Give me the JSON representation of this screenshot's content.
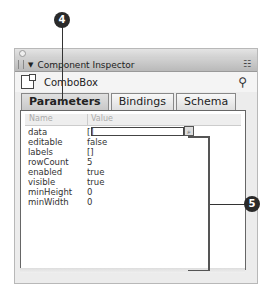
{
  "panel": {
    "title": "Component Inspector",
    "component_name": "ComboBox",
    "icons": {
      "menu": "☷",
      "help": "⚲"
    }
  },
  "tabs": [
    {
      "label": "Parameters",
      "active": true
    },
    {
      "label": "Bindings",
      "active": false
    },
    {
      "label": "Schema",
      "active": false
    }
  ],
  "grid": {
    "headers": {
      "name": "Name",
      "value": "Value"
    },
    "rows": [
      {
        "name": "data",
        "value": "[]"
      },
      {
        "name": "editable",
        "value": "false"
      },
      {
        "name": "labels",
        "value": "[]"
      },
      {
        "name": "rowCount",
        "value": "5"
      },
      {
        "name": "enabled",
        "value": "true"
      },
      {
        "name": "visible",
        "value": "true"
      },
      {
        "name": "minHeight",
        "value": "0"
      },
      {
        "name": "minWidth",
        "value": "0"
      }
    ],
    "search_button_glyph": "🔍"
  },
  "callouts": [
    {
      "number": "4"
    },
    {
      "number": "5"
    }
  ]
}
